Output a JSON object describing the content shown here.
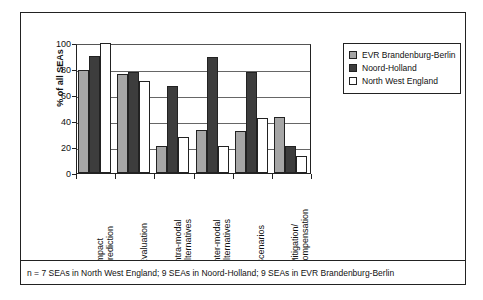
{
  "chart_data": {
    "type": "bar",
    "title": "",
    "xlabel": "",
    "ylabel": "% of all SEAs",
    "ylim": [
      0,
      100
    ],
    "yticks": [
      0,
      20,
      40,
      60,
      80,
      100
    ],
    "grid": true,
    "legend_position": "right",
    "categories": [
      "Impact\nprediction",
      "Evaluation",
      "Intra-modal\nalternatives",
      "Inter-modal\nalternatives",
      "Scenarios",
      "Mitigation/\ncompensation"
    ],
    "category_lines": [
      [
        "Impact",
        "prediction"
      ],
      [
        "Evaluation"
      ],
      [
        "Intra-modal",
        "alternatives"
      ],
      [
        "Inter-modal",
        "alternatives"
      ],
      [
        "Scenarios"
      ],
      [
        "Mitigation/",
        "compensation"
      ]
    ],
    "series": [
      {
        "name": "EVR Brandenburg-Berlin",
        "color": "#a6a6a6",
        "values": [
          79,
          76,
          21,
          33,
          32,
          43
        ]
      },
      {
        "name": "Noord-Holland",
        "color": "#3d3d3d",
        "values": [
          90,
          78,
          67,
          89,
          78,
          21
        ]
      },
      {
        "name": "North West England",
        "color": "#ffffff",
        "values": [
          100,
          71,
          28,
          21,
          42,
          13
        ]
      }
    ]
  },
  "legend": {
    "items": [
      {
        "label": "EVR Brandenburg-Berlin",
        "swatch": "#a6a6a6"
      },
      {
        "label": "Noord-Holland",
        "swatch": "#3d3d3d"
      },
      {
        "label": "North West England",
        "swatch": "#ffffff"
      }
    ]
  },
  "footnote": {
    "text": "n = 7 SEAs in North West England; 9 SEAs in Noord-Holland; 9 SEAs in EVR Brandenburg-Berlin"
  }
}
